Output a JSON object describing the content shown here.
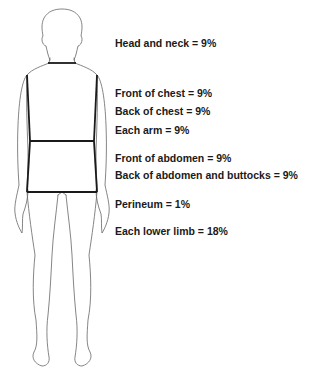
{
  "diagram": {
    "type": "rule-of-nines-body-surface-area",
    "figure": "human-body-outline",
    "outline_color": "#555555",
    "boundary_color": "#1a1a1a"
  },
  "labels": [
    {
      "id": "head-neck",
      "text": "Head and neck = 9%",
      "region": "Head and neck",
      "percent": 9
    },
    {
      "id": "front-chest",
      "text": "Front of chest = 9%",
      "region": "Front of chest",
      "percent": 9
    },
    {
      "id": "back-chest",
      "text": "Back of chest = 9%",
      "region": "Back of chest",
      "percent": 9
    },
    {
      "id": "each-arm",
      "text": "Each arm = 9%",
      "region": "Each arm",
      "percent": 9
    },
    {
      "id": "front-abdomen",
      "text": "Front of abdomen = 9%",
      "region": "Front of abdomen",
      "percent": 9
    },
    {
      "id": "back-abdomen",
      "text": "Back of abdomen and buttocks = 9%",
      "region": "Back of abdomen and buttocks",
      "percent": 9
    },
    {
      "id": "perineum",
      "text": "Perineum = 1%",
      "region": "Perineum",
      "percent": 1
    },
    {
      "id": "lower-limb",
      "text": "Each lower limb = 18%",
      "region": "Each lower limb",
      "percent": 18
    }
  ]
}
